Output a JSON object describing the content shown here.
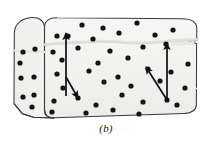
{
  "figure": {
    "caption": "(b)",
    "title": "",
    "colors": {
      "background": "#ffffff",
      "box_fill_front": "#f2f2f0",
      "box_fill_side": "#f0efed",
      "box_fill_top": "#f6f6f4",
      "box_outline": "#3a3a38",
      "dot": "#141414",
      "arrow": "#0f0f0f",
      "crease": "#e2e2de",
      "caption_text": "#15120f"
    },
    "geometry": {
      "box_outline_width": 1.0,
      "dot_radius": 2.6,
      "arrow_stroke_width": 1.7,
      "front_face": [
        [
          44,
          26
        ],
        [
          44,
          118
        ],
        [
          197,
          112
        ],
        [
          197,
          20
        ]
      ],
      "left_face": [
        [
          14,
          34
        ],
        [
          14,
          108
        ],
        [
          44,
          118
        ],
        [
          44,
          26
        ]
      ],
      "top_edge_y": 20,
      "notch_right": {
        "x": 182,
        "y_top": 40,
        "y_bottom": 50
      }
    },
    "crease_lines": [
      {
        "name": "upper-crease",
        "points": [
          [
            44,
            44
          ],
          [
            90,
            41
          ],
          [
            140,
            44
          ],
          [
            197,
            39
          ]
        ]
      },
      {
        "name": "left-face-crease",
        "points": [
          [
            14,
            50
          ],
          [
            44,
            52
          ]
        ]
      }
    ],
    "dots": [
      {
        "x": 23,
        "y": 52
      },
      {
        "x": 35,
        "y": 49
      },
      {
        "x": 21,
        "y": 78
      },
      {
        "x": 34,
        "y": 77
      },
      {
        "x": 23,
        "y": 97
      },
      {
        "x": 34,
        "y": 95
      },
      {
        "x": 32,
        "y": 107
      },
      {
        "x": 20,
        "y": 63
      },
      {
        "x": 57,
        "y": 36
      },
      {
        "x": 82,
        "y": 25
      },
      {
        "x": 103,
        "y": 28
      },
      {
        "x": 137,
        "y": 23
      },
      {
        "x": 173,
        "y": 30
      },
      {
        "x": 68,
        "y": 36
      },
      {
        "x": 93,
        "y": 39
      },
      {
        "x": 119,
        "y": 33
      },
      {
        "x": 155,
        "y": 35
      },
      {
        "x": 53,
        "y": 52
      },
      {
        "x": 78,
        "y": 48
      },
      {
        "x": 110,
        "y": 51
      },
      {
        "x": 143,
        "y": 47
      },
      {
        "x": 166,
        "y": 44
      },
      {
        "x": 57,
        "y": 74
      },
      {
        "x": 89,
        "y": 71
      },
      {
        "x": 118,
        "y": 77
      },
      {
        "x": 148,
        "y": 69
      },
      {
        "x": 171,
        "y": 72
      },
      {
        "x": 188,
        "y": 64
      },
      {
        "x": 63,
        "y": 88
      },
      {
        "x": 104,
        "y": 82
      },
      {
        "x": 131,
        "y": 86
      },
      {
        "x": 160,
        "y": 81
      },
      {
        "x": 185,
        "y": 88
      },
      {
        "x": 54,
        "y": 101
      },
      {
        "x": 78,
        "y": 98
      },
      {
        "x": 96,
        "y": 105
      },
      {
        "x": 122,
        "y": 95
      },
      {
        "x": 143,
        "y": 102
      },
      {
        "x": 167,
        "y": 100
      },
      {
        "x": 177,
        "y": 105
      },
      {
        "x": 52,
        "y": 112
      },
      {
        "x": 86,
        "y": 113
      },
      {
        "x": 113,
        "y": 110
      },
      {
        "x": 139,
        "y": 114
      },
      {
        "x": 62,
        "y": 60
      },
      {
        "x": 98,
        "y": 63
      },
      {
        "x": 128,
        "y": 58
      }
    ],
    "vectors": [
      {
        "name": "left-up-vector",
        "from": [
          66,
          96
        ],
        "to": [
          66,
          33
        ],
        "label": ""
      },
      {
        "name": "left-down-right-vector",
        "from": [
          66,
          77
        ],
        "to": [
          78,
          98
        ],
        "label": ""
      },
      {
        "name": "right-up-vector",
        "from": [
          167,
          100
        ],
        "to": [
          167,
          43
        ],
        "label": ""
      },
      {
        "name": "right-up-left-vector",
        "from": [
          167,
          100
        ],
        "to": [
          146,
          67
        ],
        "label": ""
      }
    ]
  }
}
